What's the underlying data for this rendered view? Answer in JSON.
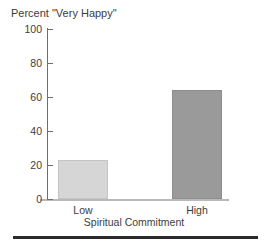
{
  "chart_data": {
    "type": "bar",
    "title": "Percent \"Very Happy\"",
    "xlabel": "Spiritual Commitment",
    "ylabel": "",
    "categories": [
      "Low",
      "High"
    ],
    "values": [
      23,
      64
    ],
    "ylim": [
      0,
      100
    ],
    "yticks": [
      0,
      20,
      40,
      60,
      80,
      100
    ],
    "ytick_labels": [
      "0",
      "20",
      "40",
      "60",
      "80",
      "100"
    ],
    "grid": false,
    "legend": false,
    "bar_colors": [
      "#d6d6d6",
      "#9a9a9a"
    ],
    "bar_edge_colors": [
      "#c4c4c4",
      "#8d8d8d"
    ],
    "axis_color": "#6e6e6e",
    "text_color": "#3c3c3c",
    "rule_color": "#2b2b2b"
  },
  "figure": {
    "background": "#ffffff",
    "has_bottom_rule": true
  }
}
